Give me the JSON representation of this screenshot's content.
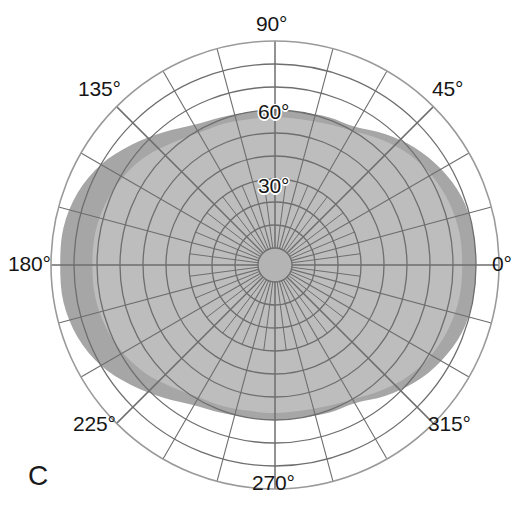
{
  "figure": {
    "panel_label": "C",
    "type": "polar-visual-field-plot"
  },
  "angular_labels": [
    {
      "text": "0°",
      "angle": 0,
      "left": 492,
      "top": 252
    },
    {
      "text": "45°",
      "angle": 45,
      "left": 432,
      "top": 77
    },
    {
      "text": "90°",
      "angle": 90,
      "left": 256,
      "top": 12
    },
    {
      "text": "135°",
      "angle": 135,
      "left": 78,
      "top": 77
    },
    {
      "text": "180°",
      "angle": 180,
      "left": 8,
      "top": 252
    },
    {
      "text": "225°",
      "angle": 225,
      "left": 73,
      "top": 412
    },
    {
      "text": "270°",
      "angle": 270,
      "left": 252,
      "top": 471
    },
    {
      "text": "315°",
      "angle": 315,
      "left": 428,
      "top": 412
    }
  ],
  "radial_labels": [
    {
      "text": "30°",
      "radius_deg": 30,
      "left": 258,
      "top": 174
    },
    {
      "text": "60°",
      "radius_deg": 60,
      "left": 258,
      "top": 100
    }
  ],
  "colors": {
    "background": "#ffffff",
    "grid_line": "#6e6e6e",
    "grid_line_outer": "#9a9a9a",
    "isopter_outer_fill": "#a6a6a6",
    "isopter_inner_fill": "#bdbdbd",
    "isopter_center_fill": "#b4b4b4",
    "text": "#161616"
  },
  "chart_data": {
    "type": "polar-area",
    "title": "",
    "subtitle": "",
    "panel": "C",
    "xlabel": "",
    "ylabel": "",
    "grid": true,
    "legend_position": "none",
    "angular_axis": {
      "units": "degrees",
      "range": [
        0,
        360
      ],
      "direction": "counterclockwise",
      "zero_at": "east",
      "tick_labels": [
        "0°",
        "45°",
        "90°",
        "135°",
        "180°",
        "225°",
        "270°",
        "315°"
      ],
      "major_tick_interval_deg": 45,
      "minor_spoke_interval_deg": 15
    },
    "radial_axis": {
      "units": "degrees eccentricity",
      "range": [
        0,
        90
      ],
      "tick_labels": [
        "30°",
        "60°"
      ],
      "labeled_at_meridian_deg": 90,
      "ring_interval_deg": 10,
      "rings": [
        10,
        20,
        30,
        40,
        50,
        60,
        70,
        80,
        90
      ]
    },
    "center_hub": {
      "radius_deg": 8,
      "description": "small unshaded central disc"
    },
    "series": [
      {
        "name": "outer isopter",
        "fill": "#a6a6a6",
        "angles_deg": [
          0,
          10,
          20,
          30,
          40,
          50,
          60,
          70,
          80,
          90,
          100,
          110,
          120,
          130,
          140,
          150,
          160,
          170,
          180,
          190,
          200,
          210,
          220,
          230,
          240,
          250,
          260,
          270,
          280,
          290,
          300,
          310,
          320,
          330,
          340,
          350
        ],
        "radii_deg": [
          80,
          80,
          79,
          76,
          72,
          67,
          62,
          61,
          60,
          60,
          60,
          61,
          63,
          68,
          74,
          80,
          84,
          86,
          86,
          86,
          84,
          80,
          74,
          68,
          63,
          61,
          60,
          60,
          60,
          61,
          62,
          67,
          72,
          76,
          79,
          80
        ]
      },
      {
        "name": "inner isopter",
        "fill": "#bdbdbd",
        "angles_deg": [
          0,
          10,
          20,
          30,
          40,
          50,
          60,
          70,
          80,
          90,
          100,
          110,
          120,
          130,
          140,
          150,
          160,
          170,
          180,
          190,
          200,
          210,
          220,
          230,
          240,
          250,
          260,
          270,
          280,
          290,
          300,
          310,
          320,
          330,
          340,
          350
        ],
        "radii_deg": [
          74,
          74,
          73,
          71,
          68,
          64,
          60,
          58,
          57,
          57,
          57,
          58,
          59,
          62,
          66,
          69,
          71,
          72,
          72,
          72,
          71,
          69,
          66,
          62,
          59,
          58,
          57,
          57,
          57,
          58,
          60,
          64,
          68,
          71,
          73,
          74
        ]
      }
    ]
  }
}
